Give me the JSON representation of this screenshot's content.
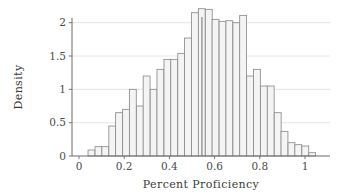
{
  "chart_data": {
    "type": "bar",
    "title": "",
    "subtitle": "",
    "xlabel": "Percent Proficiency",
    "ylabel": "Density",
    "xlim": [
      -0.06,
      1.07
    ],
    "ylim": [
      0,
      2.38
    ],
    "grid": "horizontal",
    "legend": "none",
    "bin_width": 0.0305,
    "bin_starts": [
      0.04,
      0.071,
      0.101,
      0.132,
      0.162,
      0.193,
      0.223,
      0.254,
      0.284,
      0.315,
      0.345,
      0.376,
      0.406,
      0.437,
      0.467,
      0.498,
      0.528,
      0.559,
      0.589,
      0.62,
      0.65,
      0.681,
      0.711,
      0.742,
      0.772,
      0.803,
      0.833,
      0.864,
      0.894,
      0.925,
      0.955,
      0.986
    ],
    "categories": [
      "0.040",
      "0.071",
      "0.101",
      "0.132",
      "0.162",
      "0.193",
      "0.223",
      "0.254",
      "0.284",
      "0.315",
      "0.345",
      "0.376",
      "0.406",
      "0.437",
      "0.467",
      "0.498",
      "0.528",
      "0.559",
      "0.589",
      "0.620",
      "0.650",
      "0.681",
      "0.711",
      "0.742",
      "0.772",
      "0.803",
      "0.833",
      "0.864",
      "0.894",
      "0.925",
      "0.955",
      "0.986"
    ],
    "values": [
      0.09,
      0.14,
      0.14,
      0.45,
      0.65,
      0.7,
      1.0,
      0.75,
      1.2,
      1.0,
      1.3,
      1.45,
      1.45,
      1.54,
      1.77,
      2.15,
      2.21,
      2.2,
      2.05,
      2.02,
      2.03,
      2.0,
      2.11,
      1.2,
      1.3,
      1.05,
      1.05,
      0.65,
      0.37,
      0.2,
      0.17,
      0.15
    ],
    "tail_value": 0.05,
    "xticks": [
      0,
      0.2,
      0.4,
      0.6,
      0.8,
      1
    ],
    "xtick_labels": [
      "0",
      "0.2",
      "0.4",
      "0.6",
      "0.8",
      "1"
    ],
    "yticks": [
      0,
      0.5,
      1,
      1.5,
      2
    ],
    "ytick_labels": [
      "0",
      "0.5",
      "1",
      "1.5",
      "2"
    ],
    "reference_line_x": 0.544,
    "bar_fill_color": "#f4f4f4",
    "bar_edge_color": "#8c8c8c",
    "grid_color": "#e2e2e2",
    "axis_color": "#6b6b6b"
  }
}
